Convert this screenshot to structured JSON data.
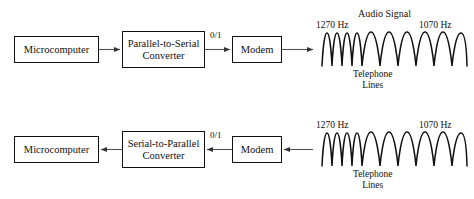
{
  "diagram": {
    "background_color": "#ffffff",
    "stroke_color": "#111111",
    "text_color": "#101010"
  },
  "rows": {
    "transmit": {
      "name": "transmit-path",
      "direction": "left-to-right",
      "nodes": {
        "microcomputer": "Microcomputer",
        "converter_line1": "Parallel-to-Serial",
        "converter_line2": "Converter",
        "modem": "Modem"
      },
      "signal_label": "0/1",
      "waveform": {
        "caption": "Audio Signal",
        "freq_left": "1270 Hz",
        "freq_right": "1070 Hz",
        "medium_line1": "Telephone",
        "medium_line2": "Lines",
        "left_cycles": 4,
        "right_cycles": 2.5,
        "left_hz": 1270,
        "right_hz": 1070
      }
    },
    "receive": {
      "name": "receive-path",
      "direction": "right-to-left",
      "nodes": {
        "microcomputer": "Microcomputer",
        "converter_line1": "Serial-to-Parallel",
        "converter_line2": "Converter",
        "modem": "Modem"
      },
      "signal_label": "0/1",
      "waveform": {
        "caption": "",
        "freq_left": "1270 Hz",
        "freq_right": "1070 Hz",
        "medium_line1": "Telephone",
        "medium_line2": "Lines",
        "left_cycles": 4,
        "right_cycles": 2.5,
        "left_hz": 1270,
        "right_hz": 1070
      }
    }
  }
}
